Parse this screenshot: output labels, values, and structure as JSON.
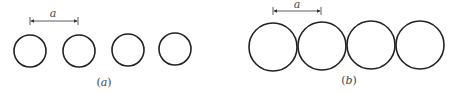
{
  "panels": [
    {
      "id": "a",
      "caption": "(a)",
      "dimension_label": "a",
      "description": "four separated circles spaced by distance a",
      "circles": [
        {
          "cx": 30,
          "cy": 51,
          "r": 16
        },
        {
          "cx": 79,
          "cy": 51,
          "r": 16
        },
        {
          "cx": 128,
          "cy": 50,
          "r": 16
        },
        {
          "cx": 175,
          "cy": 49,
          "r": 16
        }
      ],
      "dimension": {
        "x1": 30,
        "x2": 78,
        "y": 21
      },
      "caption_pos": {
        "x": 104,
        "y": 86
      },
      "label_pos": {
        "x": 53,
        "y": 17
      }
    },
    {
      "id": "b",
      "caption": "(b)",
      "dimension_label": "a",
      "description": "four touching circles with center spacing a",
      "circles": [
        {
          "cx": 273,
          "cy": 47,
          "r": 24
        },
        {
          "cx": 322,
          "cy": 46,
          "r": 24
        },
        {
          "cx": 371,
          "cy": 45,
          "r": 24
        },
        {
          "cx": 420,
          "cy": 45,
          "r": 24
        }
      ],
      "dimension": {
        "x1": 273,
        "x2": 321,
        "y": 11
      },
      "caption_pos": {
        "x": 349,
        "y": 84
      },
      "label_pos": {
        "x": 297,
        "y": 8
      }
    }
  ],
  "colors": {
    "stroke": "#222222",
    "text": "#444444"
  }
}
